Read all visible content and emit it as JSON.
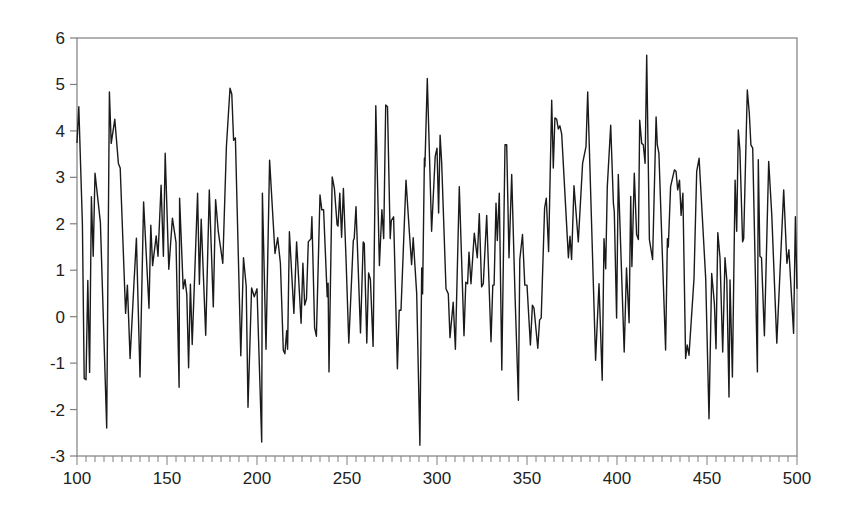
{
  "chart_data": {
    "type": "line",
    "title": "",
    "xlabel": "",
    "ylabel": "",
    "xlim": [
      100,
      500
    ],
    "ylim": [
      -3,
      6
    ],
    "x_ticks": [
      100,
      150,
      200,
      250,
      300,
      350,
      400,
      450,
      500
    ],
    "x_tick_labels": [
      "100",
      "150",
      "200",
      "250",
      "300",
      "350",
      "400",
      "450",
      "500"
    ],
    "x_minor_tick_step": 5,
    "y_ticks": [
      -3,
      -2,
      -1,
      0,
      1,
      2,
      3,
      4,
      5,
      6
    ],
    "y_tick_labels": [
      "-3",
      "-2",
      "-1",
      "0",
      "1",
      "2",
      "3",
      "4",
      "5",
      "6"
    ],
    "grid": false,
    "legend": null,
    "colors": {
      "line": "#1a1a1a",
      "frame": "#7f7f7f",
      "text": "#222222",
      "background": "#ffffff"
    },
    "series": [
      {
        "name": "series",
        "note": "key vertices read from chart (approximate)",
        "x": [
          100,
          101,
          103,
          104,
          105,
          106,
          107,
          108,
          109,
          110,
          113,
          116.5,
          118,
          119,
          121,
          123,
          124,
          127,
          128,
          129.5,
          131.5,
          133,
          135,
          137,
          140,
          141,
          142,
          144,
          145,
          146.7,
          148,
          149,
          151,
          153,
          155,
          156.7,
          157,
          159,
          160,
          161,
          162,
          163,
          164,
          167,
          168,
          169,
          171.5,
          173.5,
          175.7,
          177,
          178.5,
          181,
          183,
          185,
          186,
          187,
          188,
          191,
          192.5,
          194,
          195,
          197,
          198.5,
          200,
          202.6,
          203,
          205,
          207,
          210,
          211.5,
          213,
          214.6,
          215.5,
          216.5,
          217,
          218,
          220.5,
          222,
          224.5,
          225.5,
          226.5,
          227.5,
          228.5,
          230,
          230.5,
          232,
          233,
          235,
          236,
          237,
          239,
          239.5,
          240,
          241.8,
          243,
          244.5,
          245,
          246,
          247,
          248,
          249.5,
          251,
          253.5,
          254,
          255,
          257.5,
          259,
          259.6,
          261,
          262,
          263,
          264.5,
          265.5,
          266,
          268,
          269.4,
          270.4,
          271.5,
          272.5,
          274,
          274.6,
          275.9,
          278,
          279,
          280,
          282.8,
          284.6,
          285.9,
          286.8,
          288.7,
          290.5,
          291.5,
          292,
          293,
          293.3,
          294.6,
          297,
          299,
          300,
          300.9,
          301.7,
          302.6,
          305,
          306.3,
          307.2,
          309,
          310.2,
          312.4,
          315,
          316,
          317,
          317.8,
          318.9,
          320.7,
          322.4,
          323.5,
          324.8,
          325.7,
          327.6,
          330,
          331,
          331.7,
          332.8,
          333.5,
          334.6,
          336,
          337.8,
          338.7,
          340,
          341.5,
          343.3,
          345.2,
          346,
          347.5,
          348.8,
          350,
          351.9,
          353,
          353.9,
          356,
          357,
          357.9,
          359.8,
          360.7,
          362,
          363.7,
          364.6,
          365.5,
          366.5,
          367.4,
          368.3,
          369.3,
          373,
          373.9,
          374.8,
          376.1,
          378.5,
          380.9,
          382.8,
          383.7,
          388.1,
          390,
          391.8,
          392.8,
          393.7,
          394.6,
          396.5,
          398,
          398.5,
          399.8,
          400.7,
          404,
          405.3,
          406.7,
          407.6,
          408.3,
          409.6,
          410.9,
          411.9,
          412.6,
          413.7,
          414.6,
          415.6,
          416.5,
          418,
          419.8,
          421.7,
          422.4,
          423.3,
          427,
          428,
          428.5,
          429.8,
          431.9,
          432.8,
          433.7,
          434.7,
          435.6,
          436.6,
          438.1,
          439,
          440,
          442.8,
          444.3,
          445.6,
          449.3,
          451.1,
          452.6,
          454.1,
          455,
          456,
          457.2,
          458.7,
          460,
          461,
          462.2,
          462.8,
          464.1,
          465.6,
          466.5,
          467.4,
          468.3,
          469.8,
          470.4,
          472.4,
          473.5,
          474.4,
          475.4,
          478,
          478.5,
          479.4,
          480.3,
          481.9,
          484.3,
          486,
          488.8,
          492.6,
          494.4,
          495.5,
          498.1,
          499.1,
          500
        ],
        "y": [
          3.74,
          4.52,
          2.0,
          -1.33,
          -1.36,
          0.78,
          -1.2,
          2.58,
          1.3,
          3.09,
          2.03,
          -2.4,
          4.84,
          3.73,
          4.25,
          3.3,
          3.2,
          0.07,
          0.68,
          -0.9,
          0.61,
          1.69,
          -1.3,
          2.47,
          0.18,
          1.97,
          1.1,
          1.74,
          1.3,
          2.83,
          1.3,
          3.52,
          1.02,
          2.12,
          1.6,
          -1.52,
          2.55,
          0.6,
          0.8,
          0.48,
          -1.1,
          0.7,
          -0.6,
          2.66,
          0.7,
          2.1,
          -0.4,
          2.73,
          0.21,
          2.52,
          1.83,
          1.15,
          3.66,
          4.92,
          4.79,
          3.8,
          3.85,
          -0.84,
          1.27,
          0.66,
          -1.95,
          0.62,
          0.43,
          0.6,
          -2.7,
          2.66,
          -0.7,
          3.37,
          1.36,
          1.7,
          1.15,
          -0.72,
          -0.8,
          -0.3,
          -0.7,
          1.83,
          0.07,
          1.61,
          -0.14,
          1.15,
          0.25,
          0.39,
          1.61,
          1.68,
          2.15,
          -0.24,
          -0.42,
          2.62,
          2.3,
          2.3,
          0.43,
          0.72,
          -1.19,
          3.01,
          2.76,
          1.98,
          1.95,
          2.66,
          1.71,
          2.76,
          1.2,
          -0.57,
          1.64,
          1.68,
          2.37,
          -0.35,
          1.61,
          1.57,
          -0.57,
          0.94,
          0.8,
          -0.64,
          2.55,
          4.54,
          1.1,
          2.3,
          1.68,
          4.56,
          4.52,
          1.68,
          2.07,
          2.15,
          -1.12,
          0.14,
          0.14,
          2.94,
          1.84,
          1.12,
          1.7,
          0.49,
          -2.77,
          1.05,
          0.49,
          3.41,
          3.23,
          5.13,
          1.84,
          3.45,
          3.63,
          2.23,
          3.91,
          3.3,
          0.6,
          0.49,
          -0.45,
          0.31,
          -0.7,
          2.8,
          -0.41,
          0.74,
          0.71,
          1.39,
          0.71,
          1.8,
          1.27,
          2.22,
          0.64,
          0.71,
          2.18,
          -0.54,
          0.68,
          0.68,
          2.44,
          1.64,
          2.66,
          -1.15,
          3.7,
          3.7,
          1.27,
          3.06,
          0.55,
          -1.8,
          1.23,
          1.77,
          0.68,
          0.68,
          -0.61,
          0.25,
          0.18,
          -0.68,
          -0.07,
          -0.03,
          2.34,
          2.55,
          1.4,
          4.66,
          3.2,
          4.28,
          4.25,
          4.04,
          4.11,
          3.93,
          1.27,
          1.73,
          1.23,
          2.82,
          1.61,
          3.3,
          3.66,
          4.84,
          -0.94,
          0.71,
          -1.37,
          1.68,
          1.03,
          2.8,
          4.12,
          2.44,
          2.26,
          -0.03,
          3.06,
          -0.76,
          1.05,
          -0.13,
          2.59,
          1.08,
          3.09,
          1.77,
          1.66,
          4.23,
          3.73,
          3.7,
          3.3,
          5.63,
          1.66,
          1.23,
          4.3,
          3.7,
          3.52,
          -0.72,
          1.68,
          1.5,
          2.8,
          3.16,
          3.13,
          2.73,
          2.94,
          2.18,
          2.66,
          -0.9,
          -0.61,
          -0.83,
          0.82,
          3.13,
          3.41,
          0.82,
          -2.2,
          0.93,
          0.28,
          -0.69,
          1.81,
          1.27,
          -0.76,
          1.27,
          0.79,
          -1.73,
          0.79,
          -1.3,
          2.94,
          1.84,
          4.02,
          3.59,
          1.61,
          1.68,
          4.88,
          4.38,
          3.7,
          3.63,
          -1.19,
          3.38,
          1.3,
          1.27,
          -0.41,
          3.34,
          2.18,
          -0.57,
          2.73,
          1.15,
          1.44,
          -0.36,
          2.15,
          0.6
        ]
      }
    ]
  }
}
